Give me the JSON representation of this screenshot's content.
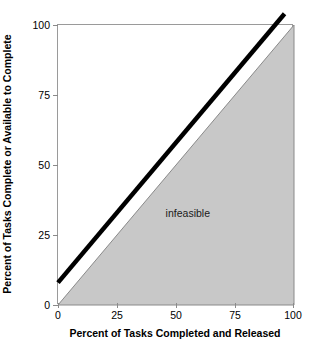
{
  "chart_data": {
    "type": "line",
    "title": "",
    "xlabel": "Percent of Tasks Completed and Released",
    "ylabel": "Percent of Tasks Complete or Available to Complete",
    "xlim": [
      0,
      100
    ],
    "ylim": [
      0,
      100
    ],
    "xticks": [
      0,
      25,
      50,
      75,
      100
    ],
    "yticks": [
      0,
      25,
      50,
      75,
      100
    ],
    "xticklabels": [
      "0",
      "25",
      "50",
      "75",
      "100"
    ],
    "yticklabels": [
      "0",
      "25",
      "50",
      "75",
      "100"
    ],
    "grid": false,
    "legend": null,
    "series": [
      {
        "name": "boundary-line",
        "style": "thick-black-line",
        "color": "#000000",
        "linewidth": 4.5,
        "x": [
          0,
          96
        ],
        "y": [
          8,
          104
        ]
      },
      {
        "name": "infeasible-region-boundary",
        "style": "thin-gray-line",
        "color": "#8a8a8a",
        "linewidth": 1,
        "x": [
          0,
          100
        ],
        "y": [
          0,
          100
        ]
      }
    ],
    "regions": [
      {
        "name": "infeasible",
        "label": "infeasible",
        "fill": "#c8c8c8",
        "stroke": "#8a8a8a",
        "polygon": [
          [
            0,
            0
          ],
          [
            100,
            100
          ],
          [
            100,
            0
          ]
        ],
        "label_position": [
          55,
          33
        ]
      }
    ],
    "annotations": [
      {
        "text": "infeasible",
        "x": 55,
        "y": 33
      }
    ]
  },
  "colors": {
    "region_fill": "#c8c8c8",
    "region_stroke": "#8a8a8a",
    "line": "#000000",
    "axis": "#9a9a9a",
    "text": "#000000",
    "background": "#ffffff"
  }
}
